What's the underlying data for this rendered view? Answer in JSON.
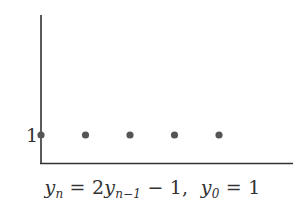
{
  "chart_data": {
    "type": "scatter",
    "title": "",
    "caption": "y_n = 2y_{n-1} - 1,  y_0 = 1",
    "xlabel": "",
    "ylabel": "",
    "x": [
      0,
      1,
      2,
      3,
      4
    ],
    "values": [
      1,
      1,
      1,
      1,
      1
    ],
    "y_tick_labels": [
      "1"
    ],
    "grid": false,
    "legend": null,
    "colors": {
      "axis": "#333333",
      "points": "#555555",
      "text": "#333333"
    }
  },
  "caption_parts": {
    "lhs_var": "y",
    "lhs_sub": "n",
    "eq1": " = 2",
    "rhs_var": "y",
    "rhs_sub": "n−1",
    "rhs_tail": " − 1,  ",
    "init_var": "y",
    "init_sub": "0",
    "init_tail": " = 1"
  }
}
